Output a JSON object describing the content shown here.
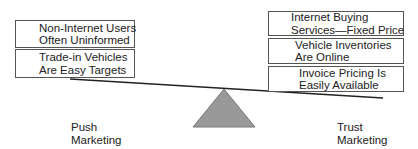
{
  "diagram": {
    "type": "seesaw-balance",
    "colors": {
      "box_border": "#555555",
      "beam": "#222222",
      "fulcrum_fill": "#999999",
      "fulcrum_stroke": "#777777",
      "text": "#222222"
    },
    "left_side": {
      "boxes": [
        {
          "line1": "Non-Internet Users",
          "line2": "Often Uninformed"
        },
        {
          "line1": "Trade-in Vehicles",
          "line2": "Are Easy Targets"
        }
      ],
      "label": {
        "line1": "Push",
        "line2": "Marketing"
      }
    },
    "right_side": {
      "boxes": [
        {
          "line1": "Internet Buying",
          "line2": "Services—Fixed Price"
        },
        {
          "line1": "Vehicle Inventories",
          "line2": "Are Online"
        },
        {
          "line1": "Invoice Pricing Is",
          "line2": "Easily Available"
        }
      ],
      "label": {
        "line1": "Trust",
        "line2": "Marketing"
      }
    }
  }
}
